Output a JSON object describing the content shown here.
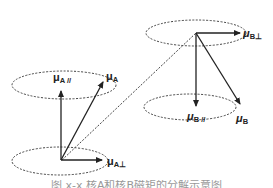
{
  "diagram": {
    "colors": {
      "stroke": "#222222",
      "dashed": "#444444",
      "background": "#ffffff"
    },
    "labels": {
      "mu_A_parallel": {
        "symbol": "μ",
        "subscript": "A //"
      },
      "mu_A": {
        "symbol": "μ",
        "subscript": "A"
      },
      "mu_A_perp": {
        "symbol": "μ",
        "subscript": "A⊥"
      },
      "mu_B_perp": {
        "symbol": "μ",
        "subscript": "B⊥"
      },
      "mu_B_parallel": {
        "symbol": "μ",
        "subscript": "B //"
      },
      "mu_B": {
        "symbol": "μ",
        "subscript": "B"
      }
    },
    "caption": "图 x-x  核A和核B磁矩的分解示意图"
  }
}
